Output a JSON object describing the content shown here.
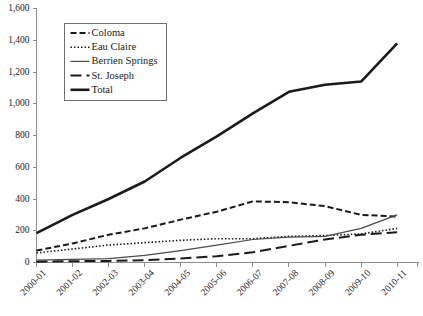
{
  "chart_data": {
    "type": "line",
    "title": "",
    "xlabel": "",
    "ylabel": "",
    "ylim": [
      0,
      1600
    ],
    "ytick_step": 200,
    "grid": false,
    "legend_position": "upper-left-inside",
    "categories": [
      "2000-01",
      "2001-02",
      "2002-03",
      "2003-04",
      "2004-05",
      "2005-06",
      "2006-07",
      "2007-08",
      "2008-09",
      "2009-10",
      "2010-11"
    ],
    "ytick_labels": [
      "0",
      "200",
      "400",
      "600",
      "800",
      "1,000",
      "1,200",
      "1,400",
      "1,600"
    ],
    "ytick_values": [
      0,
      200,
      400,
      600,
      800,
      1000,
      1200,
      1400,
      1600
    ],
    "series": [
      {
        "name": "Coloma",
        "style": "dashed",
        "color": "#1a1a1a",
        "width": 2,
        "dash": "6,3",
        "values": [
          75,
          120,
          175,
          215,
          270,
          320,
          385,
          380,
          355,
          300,
          290
        ]
      },
      {
        "name": "Eau Claire",
        "style": "dotted",
        "color": "#1a1a1a",
        "width": 1.6,
        "dash": "1.5,2",
        "values": [
          60,
          85,
          110,
          125,
          140,
          150,
          150,
          165,
          170,
          180,
          215
        ]
      },
      {
        "name": "Berrien Springs",
        "style": "solid-thin",
        "color": "#4a4a4a",
        "width": 1.2,
        "dash": "none",
        "values": [
          15,
          20,
          25,
          45,
          75,
          110,
          145,
          160,
          165,
          215,
          300
        ]
      },
      {
        "name": "St. Joseph",
        "style": "long-dash",
        "color": "#1a1a1a",
        "width": 2,
        "dash": "11,5",
        "values": [
          5,
          8,
          10,
          15,
          25,
          40,
          65,
          105,
          145,
          175,
          190
        ]
      },
      {
        "name": "Total",
        "style": "solid-thick",
        "color": "#1a1a1a",
        "width": 2.6,
        "dash": "none",
        "values": [
          185,
          300,
          400,
          510,
          660,
          795,
          940,
          1075,
          1120,
          1140,
          1380
        ]
      }
    ]
  },
  "legend": {
    "items": [
      {
        "label": "Coloma"
      },
      {
        "label": "Eau Claire"
      },
      {
        "label": "Berrien Springs"
      },
      {
        "label": "St. Joseph"
      },
      {
        "label": "Total"
      }
    ]
  }
}
